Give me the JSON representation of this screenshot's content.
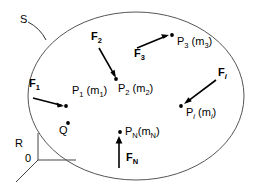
{
  "figure": {
    "background_color": "#ffffff",
    "line_color": "#000000",
    "boundary_color": "#555555"
  },
  "boundary": {
    "name": "S",
    "label": "S",
    "shape": "ellipse",
    "cx": 136,
    "cy": 96,
    "rx": 108,
    "ry": 84,
    "leader_from": [
      28,
      22
    ],
    "leader_to": [
      52,
      38
    ]
  },
  "frame": {
    "label": "R",
    "origin_label": "0",
    "origin": [
      38,
      160
    ],
    "axes": [
      {
        "name": "vertical-axis",
        "to": [
          38,
          133
        ]
      },
      {
        "name": "horizontal-axis",
        "to": [
          76,
          160
        ]
      },
      {
        "name": "diagonal-axis",
        "to": [
          16,
          182
        ]
      }
    ]
  },
  "particles": [
    {
      "name": "P1",
      "label_p": "P",
      "sub_p": "1",
      "label_m": "(m",
      "sub_m": "1",
      "label_close": ")",
      "dot": [
        66,
        105
      ],
      "text_pos": [
        72,
        84
      ]
    },
    {
      "name": "P2",
      "label_p": "P",
      "sub_p": "2",
      "label_m": "(m",
      "sub_m": "2",
      "label_close": ")",
      "dot": [
        117,
        80
      ],
      "text_pos": [
        118,
        83
      ]
    },
    {
      "name": "P3",
      "label_p": "P",
      "sub_p": "3",
      "label_m": "(m",
      "sub_m": "3",
      "label_close": ")",
      "dot": [
        172,
        36
      ],
      "text_pos": [
        176,
        38
      ]
    },
    {
      "name": "Pi",
      "label_p": "P",
      "sub_p": "i",
      "label_m": "(m",
      "sub_m": "i",
      "label_close": ")",
      "dot": [
        180,
        106
      ],
      "text_pos": [
        184,
        108
      ]
    },
    {
      "name": "PN",
      "label_p": "P",
      "sub_p": "N",
      "label_m": "(m",
      "sub_m": "N",
      "label_close": ")",
      "dot": [
        119,
        131
      ],
      "text_pos": [
        123,
        131
      ]
    }
  ],
  "extra_point": {
    "name": "Q",
    "label": "Q",
    "dot": [
      65,
      124
    ],
    "text_pos": [
      57,
      129
    ]
  },
  "forces": [
    {
      "name": "F1",
      "label_f": "F",
      "sub_f": "1",
      "text_pos": [
        31,
        83
      ],
      "arrow_from": [
        33,
        98
      ],
      "arrow_to": [
        64,
        106
      ]
    },
    {
      "name": "F2",
      "label_f": "F",
      "sub_f": "2",
      "text_pos": [
        93,
        36
      ],
      "arrow_from": [
        99,
        48
      ],
      "arrow_to": [
        116,
        78
      ]
    },
    {
      "name": "F3",
      "label_f": "F",
      "sub_f": "3",
      "text_pos": [
        136,
        52
      ],
      "arrow_from": [
        137,
        48
      ],
      "arrow_to": [
        169,
        35
      ]
    },
    {
      "name": "Fi",
      "label_f": "F",
      "sub_f": "i",
      "text_pos": [
        221,
        72
      ],
      "arrow_from": [
        216,
        80
      ],
      "arrow_to": [
        184,
        104
      ]
    },
    {
      "name": "FN",
      "label_f": "F",
      "sub_f": "N",
      "text_pos": [
        129,
        157
      ],
      "arrow_from": [
        119,
        168
      ],
      "arrow_to": [
        119,
        137
      ]
    }
  ]
}
